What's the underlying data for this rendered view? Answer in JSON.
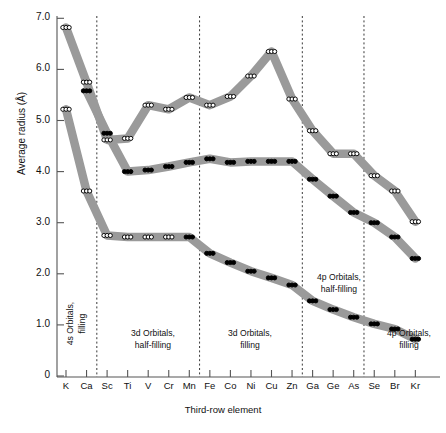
{
  "chart_data": {
    "type": "line",
    "title": "",
    "xlabel": "Third-row element",
    "ylabel": "Average radius (Å)",
    "categories": [
      "K",
      "Ca",
      "Sc",
      "Ti",
      "V",
      "Cr",
      "Mn",
      "Fe",
      "Co",
      "Ni",
      "Cu",
      "Zn",
      "Ga",
      "Ge",
      "As",
      "Se",
      "Br",
      "Kr"
    ],
    "ylim": [
      0,
      7.3
    ],
    "yticks": [
      "0",
      "1.0",
      "2.0",
      "3.0",
      "4.0",
      "5.0",
      "6.0",
      "7.0"
    ],
    "ytick_values": [
      0,
      1.0,
      2.0,
      3.0,
      4.0,
      5.0,
      6.0,
      7.0
    ],
    "grid": false,
    "legend": "none",
    "series": [
      {
        "name": "4s orbital radius",
        "marker": "open-circle",
        "values": [
          6.82,
          5.75,
          4.62,
          4.65,
          5.3,
          5.22,
          5.45,
          5.3,
          5.47,
          5.87,
          6.35,
          5.42,
          4.8,
          4.35,
          4.35,
          3.92,
          3.62,
          3.02
        ]
      },
      {
        "name": "3d orbital radius",
        "marker": "filled-circle",
        "values": [
          null,
          5.58,
          4.75,
          4.0,
          4.03,
          4.1,
          4.18,
          4.25,
          4.18,
          4.2,
          4.2,
          4.2,
          3.85,
          3.52,
          3.2,
          3.0,
          2.72,
          2.3
        ]
      },
      {
        "name": "3p / core orbital radius",
        "marker": "open-to-filled-circle",
        "values": [
          5.22,
          3.62,
          2.75,
          2.72,
          2.72,
          2.72,
          2.72,
          2.4,
          2.22,
          2.05,
          1.92,
          1.78,
          1.47,
          1.3,
          1.15,
          1.02,
          0.92,
          0.72
        ]
      }
    ],
    "dividers": [
      "Ca|Sc",
      "Mn|Fe",
      "Zn|Ga",
      "As|Se"
    ],
    "region_labels": [
      {
        "text": "4s Orbitals,\nfilling",
        "orientation": "vertical"
      },
      {
        "text": "3d Orbitals,\nhalf-filling",
        "orientation": "horizontal"
      },
      {
        "text": "3d Orbitals,\nfilling",
        "orientation": "horizontal"
      },
      {
        "text": "4p Orbitals,\nhalf-filling",
        "orientation": "horizontal"
      },
      {
        "text": "4p Orbitals,\nfilling",
        "orientation": "horizontal"
      }
    ],
    "colors": {
      "band": "#9a9a9a",
      "marker_fill": "#ffffff",
      "marker_edge": "#000000",
      "axis": "#555555"
    }
  }
}
